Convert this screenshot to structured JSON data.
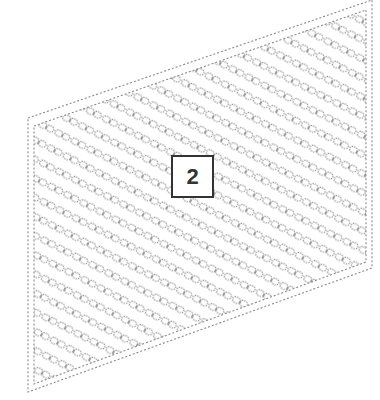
{
  "figure": {
    "reference_label": "2",
    "colors": {
      "background": "#ffffff",
      "line": "#8a8a8a",
      "label_border": "#333333",
      "label_text": "#333333"
    },
    "panel": {
      "outer_corners": [
        [
          28,
          118
        ],
        [
          372,
          0
        ],
        [
          372,
          268
        ],
        [
          28,
          392
        ]
      ],
      "inner_corners": [
        [
          34,
          126
        ],
        [
          366,
          10
        ],
        [
          366,
          262
        ],
        [
          34,
          384
        ]
      ],
      "chain_rows": 20,
      "chain_direction": "diagonal, upper-left to lower-right"
    }
  }
}
